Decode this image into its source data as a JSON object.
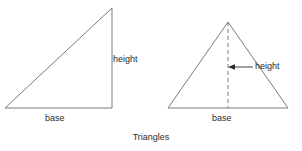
{
  "figure": {
    "caption": "Triangles",
    "stroke_color": "#7a7a7a",
    "text_color": "#2b2b2b",
    "background_color": "#ffffff",
    "width": 302,
    "height": 151
  },
  "left_triangle": {
    "name": "right-triangle",
    "height_label": "height",
    "base_label": "base",
    "vertices": [
      [
        5,
        108
      ],
      [
        112,
        108
      ],
      [
        112,
        8
      ]
    ],
    "base_segment": [
      [
        5,
        108
      ],
      [
        112,
        108
      ]
    ],
    "height_segment": [
      [
        112,
        8
      ],
      [
        112,
        108
      ]
    ],
    "hypotenuse_segment": [
      [
        5,
        108
      ],
      [
        112,
        8
      ]
    ]
  },
  "right_triangle": {
    "name": "isosceles-triangle",
    "height_label": "height",
    "base_label": "base",
    "vertices": [
      [
        168,
        108
      ],
      [
        288,
        108
      ],
      [
        228,
        22
      ]
    ],
    "base_segment": [
      [
        168,
        108
      ],
      [
        288,
        108
      ]
    ],
    "altitude_dashed_segment": [
      [
        228,
        22
      ],
      [
        228,
        108
      ]
    ],
    "leader_line": [
      [
        253,
        67
      ],
      [
        232,
        67
      ]
    ],
    "arrow_points_to": [
      228,
      67
    ]
  }
}
